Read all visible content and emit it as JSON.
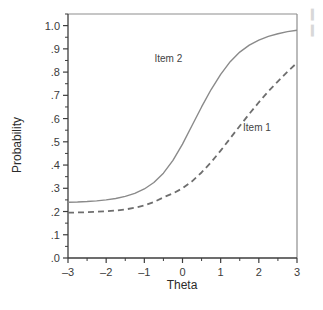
{
  "chart_data": {
    "type": "line",
    "title": "",
    "subtitle": "",
    "xlabel": "Theta",
    "ylabel": "Probability",
    "xlim": [
      -3,
      3
    ],
    "ylim": [
      0.0,
      1.05
    ],
    "grid": false,
    "legend_position": "inline-annotation",
    "x_ticks": [
      -3,
      -2,
      -1,
      0,
      1,
      2,
      3
    ],
    "x_tick_labels": [
      "–3",
      "–2",
      "–1",
      "0",
      "1",
      "2",
      "3"
    ],
    "x_minor_ticks": [
      -2.5,
      -1.5,
      -0.5,
      0.5,
      1.5,
      2.5
    ],
    "y_ticks": [
      0.0,
      0.1,
      0.2,
      0.3,
      0.4,
      0.5,
      0.6,
      0.7,
      0.8,
      0.9,
      1.0
    ],
    "y_tick_labels": [
      ".0",
      ".1",
      ".2",
      ".3",
      ".4",
      ".5",
      ".6",
      ".7",
      ".8",
      ".9",
      "1.0"
    ],
    "y_minor_ticks": [
      0.05,
      0.15,
      0.25,
      0.35,
      0.45,
      0.55,
      0.65,
      0.75,
      0.85,
      0.95,
      1.05
    ],
    "x": [
      -3.0,
      -2.75,
      -2.5,
      -2.25,
      -2.0,
      -1.75,
      -1.5,
      -1.25,
      -1.0,
      -0.75,
      -0.5,
      -0.25,
      0.0,
      0.25,
      0.5,
      0.75,
      1.0,
      1.25,
      1.5,
      1.75,
      2.0,
      2.25,
      2.5,
      2.75,
      3.0
    ],
    "series": [
      {
        "name": "Item 1",
        "style": "dashed",
        "color": "#6e6e6e",
        "label_x": 1.95,
        "label_y": 0.545,
        "values": [
          0.195,
          0.196,
          0.197,
          0.199,
          0.201,
          0.204,
          0.209,
          0.216,
          0.226,
          0.241,
          0.261,
          0.278,
          0.3,
          0.33,
          0.368,
          0.412,
          0.462,
          0.515,
          0.568,
          0.62,
          0.67,
          0.717,
          0.76,
          0.802,
          0.84
        ]
      },
      {
        "name": "Item 2",
        "style": "solid",
        "color": "#8a8a8a",
        "label_x": -0.37,
        "label_y": 0.845,
        "values": [
          0.24,
          0.241,
          0.243,
          0.246,
          0.25,
          0.256,
          0.265,
          0.278,
          0.297,
          0.325,
          0.365,
          0.42,
          0.49,
          0.57,
          0.65,
          0.725,
          0.79,
          0.845,
          0.886,
          0.916,
          0.938,
          0.954,
          0.965,
          0.974,
          0.98
        ]
      }
    ],
    "annotations": [
      {
        "text": "Item 1",
        "x": 1.95,
        "y": 0.545
      },
      {
        "text": "Item 2",
        "x": -0.37,
        "y": 0.845
      }
    ]
  },
  "edge_fragments": [
    "▍",
    "▍"
  ]
}
